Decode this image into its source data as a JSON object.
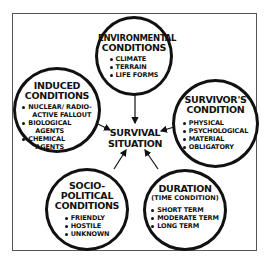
{
  "diagram": {
    "center": {
      "line1": "SURVIVAL",
      "line2": "SITUATION"
    },
    "nodes": {
      "environmental": {
        "title_line1": "ENVIRONMENTAL",
        "title_line2": "CONDITIONS",
        "items": [
          "CLIMATE",
          "TERRAIN",
          "LIFE FORMS"
        ]
      },
      "induced": {
        "title_line1": "INDUCED",
        "title_line2": "CONDITIONS",
        "items": [
          {
            "line1": "NUCLEAR/ RADIO-",
            "line2": "ACTIVE FALLOUT"
          },
          {
            "line1": "BIOLOGICAL",
            "line2": "AGENTS"
          },
          {
            "line1": "CHEMICAL",
            "line2": "AGENTS"
          }
        ]
      },
      "survivor": {
        "title_line1": "SURVIVOR'S",
        "title_line2": "CONDITION",
        "items": [
          "PHYSICAL",
          "PSYCHOLOGICAL",
          "MATERIAL",
          "OBLIGATORY"
        ]
      },
      "sociopolitical": {
        "title_line1": "SOCIO-",
        "title_line2": "POLITICAL",
        "title_line3": "CONDITIONS",
        "items": [
          "FRIENDLY",
          "HOSTILE",
          "UNKNOWN"
        ]
      },
      "duration": {
        "title_line1": "DURATION",
        "subtitle": "(TIME CONDITION)",
        "items": [
          "SHORT TERM",
          "MODERATE TERM",
          "LONG TERM"
        ]
      }
    },
    "colors": {
      "ink": "#111111",
      "frame": "#555555",
      "background": "#ffffff"
    }
  }
}
